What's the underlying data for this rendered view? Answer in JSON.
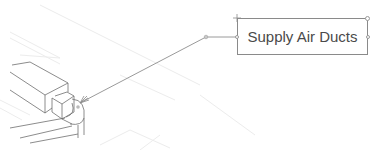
{
  "viewport": {
    "type": "cad-drawing-canvas",
    "background": "#ffffff"
  },
  "annotation": {
    "label": "Supply Air Ducts",
    "leader": {
      "arrow_tip": [
        80,
        103
      ],
      "elbow": [
        206,
        37
      ],
      "attach": [
        237,
        37
      ]
    },
    "colors": {
      "box_border": "#8a8a8a",
      "text": "#4a4a4a",
      "leader": "#9a9a9a"
    }
  },
  "icons": {
    "move_grip": "move-cross-icon",
    "grips": "grip-circle-icon"
  }
}
